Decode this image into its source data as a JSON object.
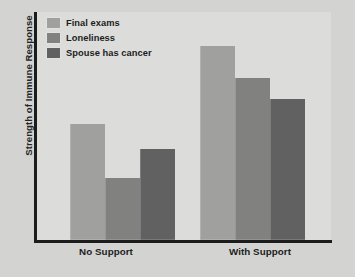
{
  "chart_data": {
    "type": "bar",
    "title": "",
    "xlabel": "",
    "ylabel": "Strength of Immune Response",
    "categories": [
      "No Support",
      "With Support"
    ],
    "series": [
      {
        "name": "Final exams",
        "values": [
          51,
          85
        ],
        "color": "#a0a09e"
      },
      {
        "name": "Loneliness",
        "values": [
          27,
          71
        ],
        "color": "#81817f"
      },
      {
        "name": "Spouse has cancer",
        "values": [
          40,
          62
        ],
        "color": "#616161"
      }
    ],
    "ylim": [
      0,
      100
    ],
    "y_tick_labels": [],
    "grid": false,
    "legend_position": "top-left",
    "annotations": []
  },
  "figure": {
    "background_color": "#d3d3d1",
    "plot_background_color": "#dcdcda",
    "axis_color": "#1c1c1c",
    "text_color": "#1d1d1d"
  }
}
